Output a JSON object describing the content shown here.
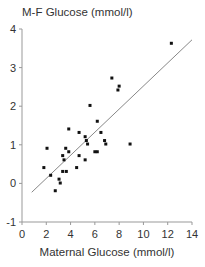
{
  "chart_data": {
    "type": "scatter",
    "title": "",
    "ylabel": "M-F Glucose (mmol/l)",
    "xlabel": "Maternal Glucose (mmol/l)",
    "xlim": [
      0,
      14
    ],
    "ylim": [
      -1,
      4
    ],
    "xticks": [
      0,
      2,
      4,
      6,
      8,
      10,
      12,
      14
    ],
    "yticks": [
      -1,
      0,
      1,
      2,
      3,
      4
    ],
    "grid": false,
    "legend": null,
    "series": [
      {
        "name": "observations",
        "marker": "square",
        "color": "#111111",
        "points": [
          [
            12.3,
            3.63
          ],
          [
            7.4,
            2.73
          ],
          [
            8.0,
            2.52
          ],
          [
            7.9,
            2.42
          ],
          [
            5.6,
            2.02
          ],
          [
            6.2,
            1.61
          ],
          [
            3.85,
            1.41
          ],
          [
            4.7,
            1.32
          ],
          [
            6.5,
            1.32
          ],
          [
            5.2,
            1.21
          ],
          [
            5.3,
            1.11
          ],
          [
            6.8,
            1.11
          ],
          [
            5.4,
            1.02
          ],
          [
            6.9,
            1.02
          ],
          [
            8.9,
            1.02
          ],
          [
            2.06,
            0.91
          ],
          [
            3.6,
            0.91
          ],
          [
            3.85,
            0.82
          ],
          [
            6.0,
            0.82
          ],
          [
            6.2,
            0.82
          ],
          [
            3.35,
            0.72
          ],
          [
            4.7,
            0.72
          ],
          [
            3.46,
            0.61
          ],
          [
            5.2,
            0.61
          ],
          [
            1.8,
            0.41
          ],
          [
            3.35,
            0.31
          ],
          [
            3.65,
            0.31
          ],
          [
            4.5,
            0.41
          ],
          [
            2.36,
            0.21
          ],
          [
            3.05,
            0.11
          ],
          [
            3.15,
            0.01
          ],
          [
            2.74,
            -0.19
          ]
        ]
      }
    ],
    "regression_line": {
      "color": "#888888",
      "from": [
        0.8,
        -0.23
      ],
      "to": [
        14.0,
        3.72
      ]
    }
  },
  "labels": {
    "y_axis_title": "M-F Glucose (mmol/l)",
    "x_axis_title": "Maternal Glucose (mmol/l)"
  }
}
